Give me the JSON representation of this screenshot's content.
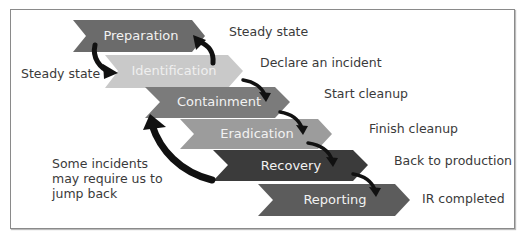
{
  "diagram": {
    "type": "incident-response-process",
    "phases": [
      {
        "label": "Preparation",
        "color": "#6b6b6b",
        "note": "Steady state"
      },
      {
        "label": "Identification",
        "color": "#c9c9c9",
        "note": "Declare an incident"
      },
      {
        "label": "Containment",
        "color": "#7b7b7b",
        "note": "Start cleanup"
      },
      {
        "label": "Eradication",
        "color": "#9c9c9c",
        "note": "Finish cleanup"
      },
      {
        "label": "Recovery",
        "color": "#3b3b3b",
        "note": "Back to production"
      },
      {
        "label": "Reporting",
        "color": "#5c5c5c",
        "note": "IR completed"
      }
    ],
    "left_note": "Steady state",
    "jump_back_note": "Some incidents may require us to jump back",
    "arrow_color": "#111111"
  }
}
